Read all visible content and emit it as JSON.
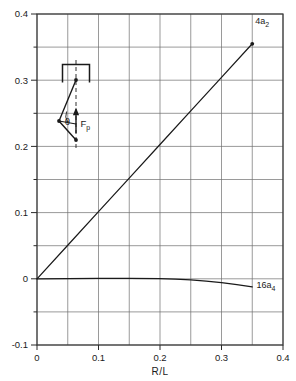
{
  "figure": {
    "background_color": "#ffffff",
    "ink_color": "#1a1a1a",
    "grid_color": "#6b6b6b"
  },
  "chart_data": {
    "type": "line",
    "title": "",
    "subtitle": "",
    "xlabel": "R/L",
    "ylabel": "",
    "xlim": [
      0,
      0.4
    ],
    "ylim": [
      -0.1,
      0.4
    ],
    "xticks": [
      0,
      0.1,
      0.2,
      0.3,
      0.4
    ],
    "xtick_labels": [
      "0",
      "0.1",
      "0.2",
      "0.3",
      "0.4"
    ],
    "yticks": [
      -0.1,
      0,
      0.1,
      0.2,
      0.3,
      0.4
    ],
    "ytick_labels": [
      "-0.1",
      "0",
      "0.1",
      "0.2",
      "0.3",
      "0.4"
    ],
    "x_minor_step": 0.05,
    "y_minor_step": 0.05,
    "grid": true,
    "grid_style": "solid rectangular mesh at 0.05 intervals",
    "legend": "inline end-of-curve labels",
    "legend_position": "at curve endpoints",
    "series": [
      {
        "name": "4a_2",
        "label": "4a",
        "label_sub": "2",
        "label_x": 0.355,
        "label_y": 0.385,
        "endpoint_marker": true,
        "x": [
          0,
          0.05,
          0.1,
          0.15,
          0.2,
          0.25,
          0.3,
          0.35
        ],
        "values": [
          0,
          0.0507,
          0.1014,
          0.1521,
          0.2029,
          0.2536,
          0.3043,
          0.355
        ]
      },
      {
        "name": "16a_4",
        "label": "16a",
        "label_sub": "4",
        "label_x": 0.357,
        "label_y": -0.0135,
        "endpoint_marker": false,
        "x": [
          0,
          0.05,
          0.1,
          0.15,
          0.2,
          0.225,
          0.25,
          0.275,
          0.3,
          0.325,
          0.35
        ],
        "values": [
          0,
          0.0004,
          0.0007,
          0.0006,
          0.0002,
          -0.0005,
          -0.0017,
          -0.0035,
          -0.0058,
          -0.0088,
          -0.0122
        ]
      }
    ],
    "annotations": [
      {
        "name": "force-diagram-inset",
        "type": "vector-diagram",
        "theta_label": "θ",
        "force_label": "F",
        "force_label_sub": "p",
        "description": "triangle with apex under fixed support bracket, dashed vertical centerline, upward force vector F_p and angle theta"
      }
    ]
  },
  "axis_titles": {
    "x": "R/L"
  },
  "inset": {
    "theta": "θ",
    "force": "F",
    "force_sub": "p"
  }
}
